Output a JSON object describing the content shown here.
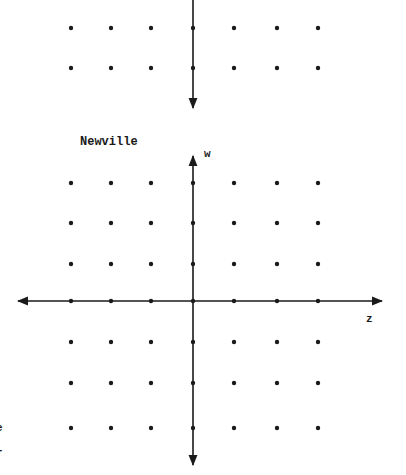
{
  "figure": {
    "title_label": "Newville",
    "vertical_axis_label": "w",
    "horizontal_axis_label": "z",
    "left_edge_fragments": [
      "e",
      "r"
    ],
    "colors": {
      "ink": "#1a1a1a",
      "background": "#ffffff"
    }
  },
  "upper_grid": {
    "columns_x": [
      71,
      111,
      151,
      193,
      234,
      277,
      318
    ],
    "rows_y": [
      28,
      68
    ],
    "axis_x": 193,
    "axis_arrow": "down"
  },
  "lower_grid": {
    "columns_x": [
      71,
      111,
      151,
      193,
      234,
      277,
      318
    ],
    "rows_y": [
      183,
      223,
      264,
      301,
      342,
      383,
      428
    ],
    "origin": {
      "x": 193,
      "y": 301
    },
    "w_axis": {
      "top_arrow": true,
      "bottom_arrow": true
    },
    "z_axis": {
      "left_arrow": true,
      "right_arrow": true
    }
  }
}
